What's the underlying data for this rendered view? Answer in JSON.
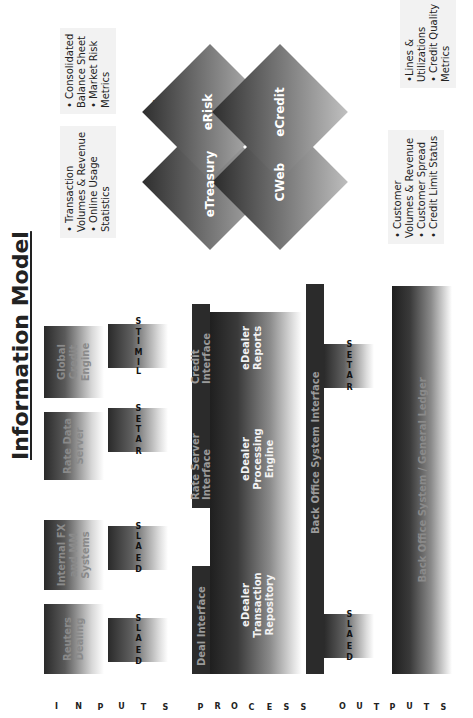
{
  "title": "Information Model",
  "sections": {
    "inputs": "INPUTS",
    "processes": "PROCESSES",
    "outputs": "OUTPUTS"
  },
  "sources": [
    {
      "label_line1": "Reuters",
      "label_line2": "Dealing",
      "flow": "DEALS"
    },
    {
      "label_line1": "Internal FX",
      "label_line2": "and MM",
      "label_line3": "Systems",
      "flow": "DEALS"
    },
    {
      "label_line1": "Rate Data",
      "label_line2": "Server",
      "flow": "RATES"
    },
    {
      "label_line1": "Global Credit",
      "label_line2": "Engine",
      "flow": "LIMITS"
    }
  ],
  "interfaces": {
    "deal": "Deal Interface",
    "rate": "Rate Server Interface",
    "credit": "Credit Interface",
    "back_office": "Back Office System Interface"
  },
  "processes": {
    "repository": {
      "line1": "eDealer",
      "line2": "Transaction",
      "line3": "Repository"
    },
    "engine": {
      "line1": "eDealer",
      "line2": "Processing",
      "line3": "Engine"
    },
    "reports": {
      "line1": "eDealer",
      "line2": "Reports"
    }
  },
  "outputs": {
    "flow_deals": "DEALS",
    "flow_rates": "RATES",
    "ledger": "Back Office System / General Ledger"
  },
  "mis": {
    "label": "MIS",
    "modules": {
      "eRisk": "eRisk",
      "eCredit": "eCredit",
      "eTreasury": "eTreasury",
      "CWeb": "CWeb"
    }
  },
  "callouts": {
    "treasury": [
      "• Transaction",
      "Volumes & Revenue",
      "• Online Usage",
      "Statistics"
    ],
    "risk": [
      "• Consolidated",
      "Balance Sheet",
      "• Market Risk",
      "Metrics"
    ],
    "cweb": [
      "• Customer",
      "Volumes & Revenue",
      "• Customer Spread",
      "• Credit Limit Status"
    ],
    "credit": [
      "•Lines &",
      "Utilizations",
      "• Credit Quality",
      "Metrics"
    ]
  }
}
